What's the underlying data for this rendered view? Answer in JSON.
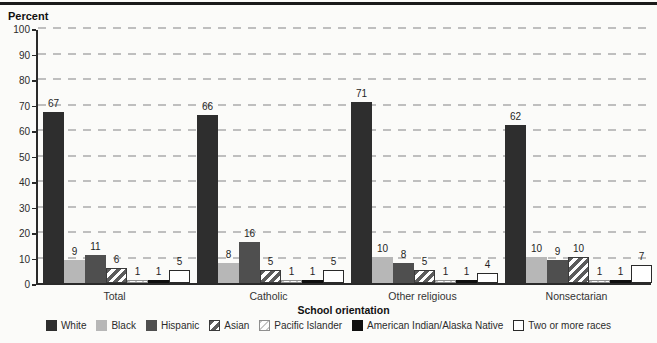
{
  "chart_data": {
    "type": "bar",
    "title": "",
    "ylabel": "Percent",
    "xlabel": "School orientation",
    "ylim": [
      0,
      100
    ],
    "ytick_step": 10,
    "yticks": [
      0,
      10,
      20,
      30,
      40,
      50,
      60,
      70,
      80,
      90,
      100
    ],
    "grid": "dashed-horizontal",
    "legend_position": "bottom",
    "categories": [
      "Total",
      "Catholic",
      "Other religious",
      "Nonsectarian"
    ],
    "series": [
      {
        "name": "White",
        "style": "solid",
        "color": "#2e2e2e",
        "values": [
          67,
          66,
          71,
          62
        ]
      },
      {
        "name": "Black",
        "style": "solid",
        "color": "#b7b7b7",
        "values": [
          9,
          8,
          10,
          10
        ]
      },
      {
        "name": "Hispanic",
        "style": "solid",
        "color": "#4f4f4f",
        "values": [
          11,
          16,
          8,
          9
        ]
      },
      {
        "name": "Asian",
        "style": "hatch-dark",
        "color": "#5c5c5c",
        "values": [
          6,
          5,
          5,
          10
        ]
      },
      {
        "name": "Pacific Islander",
        "style": "hatch-light",
        "color": "#c9c9c9",
        "values": [
          1,
          1,
          1,
          1
        ]
      },
      {
        "name": "American Indian/Alaska Native",
        "style": "solid",
        "color": "#0f0f0f",
        "values": [
          1,
          1,
          1,
          1
        ]
      },
      {
        "name": "Two or more races",
        "style": "outline",
        "color": "#ffffff",
        "values": [
          5,
          5,
          4,
          7
        ]
      }
    ]
  }
}
